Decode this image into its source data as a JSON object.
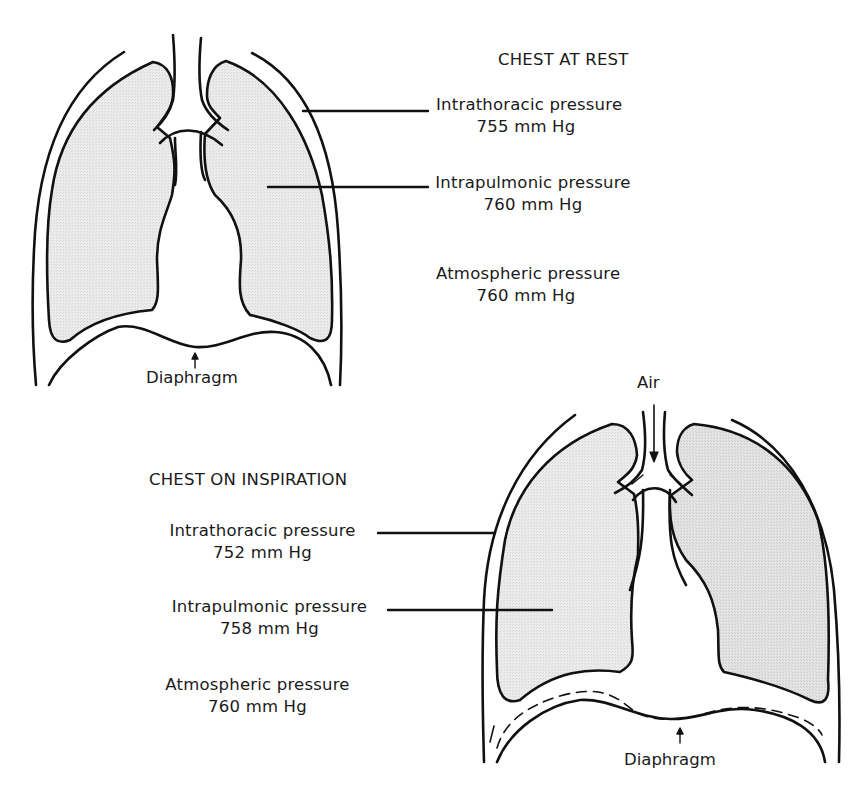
{
  "rest": {
    "title": "CHEST AT REST",
    "labels": [
      {
        "name": "Intrathoracic pressure",
        "value": "755 mm Hg"
      },
      {
        "name": "Intrapulmonic pressure",
        "value": "760 mm Hg"
      },
      {
        "name": "Atmospheric pressure",
        "value": "760 mm Hg"
      }
    ],
    "diaphragm_label": "Diaphragm"
  },
  "inspiration": {
    "title": "CHEST ON INSPIRATION",
    "air_label": "Air",
    "labels": [
      {
        "name": "Intrathoracic pressure",
        "value": "752 mm Hg"
      },
      {
        "name": "Intrapulmonic pressure",
        "value": "758 mm Hg"
      },
      {
        "name": "Atmospheric pressure",
        "value": "760 mm Hg"
      }
    ],
    "diaphragm_label": "Diaphragm"
  },
  "colors": {
    "line": "#111111",
    "lung_fill": "#e6e6e6",
    "background": "#ffffff"
  }
}
